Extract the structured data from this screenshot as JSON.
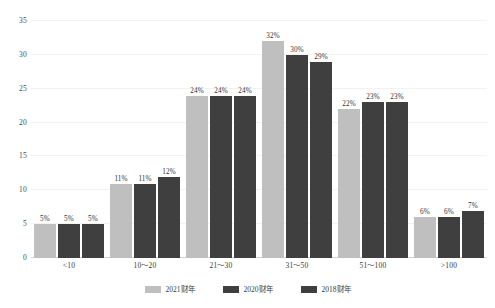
{
  "chart_data": {
    "type": "bar",
    "title": "",
    "subtitle": "",
    "xlabel": "",
    "ylabel": "",
    "ylim": [
      0,
      35
    ],
    "y_ticks": [
      0,
      5,
      10,
      15,
      20,
      25,
      30,
      35
    ],
    "grid": true,
    "legend_position": "bottom-center",
    "grouping": "clustered",
    "value_label_suffix": "%",
    "categories": [
      "<10",
      "10～20",
      "21～30",
      "31～50",
      "51～100",
      ">100"
    ],
    "series": [
      {
        "name": "2021财年",
        "color": "#bfbfbf",
        "values": [
          5,
          11,
          24,
          32,
          22,
          6
        ],
        "labels": [
          "5%",
          "11%",
          "24%",
          "32%",
          "22%",
          "6%"
        ]
      },
      {
        "name": "2020财年",
        "color": "#3f3f3f",
        "values": [
          5,
          11,
          24,
          30,
          23,
          6
        ],
        "labels": [
          "5%",
          "11%",
          "24%",
          "30%",
          "23%",
          "6%"
        ]
      },
      {
        "name": "2018财年",
        "color": "#3f3f3f",
        "values": [
          5,
          12,
          24,
          29,
          23,
          7
        ],
        "labels": [
          "5%",
          "12%",
          "24%",
          "29%",
          "23%",
          "7%"
        ]
      }
    ]
  },
  "colors": {
    "series_2021": "#bfbfbf",
    "series_2020": "#3f3f3f",
    "series_2018": "#3f3f3f",
    "gridline": "#f2f2f2",
    "axis": "#d4d4d4",
    "text": "#3a3a3a",
    "background": "#ffffff"
  }
}
